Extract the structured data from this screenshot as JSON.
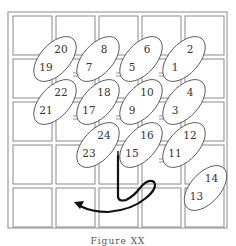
{
  "grid": {
    "rows": 5,
    "cols": 5,
    "line_color": "#8a8a8a"
  },
  "ellipses": [
    {
      "labels": [
        "20",
        "19"
      ],
      "col": 1,
      "row": 1
    },
    {
      "labels": [
        "8",
        "7"
      ],
      "col": 2,
      "row": 1
    },
    {
      "labels": [
        "6",
        "5"
      ],
      "col": 3,
      "row": 1
    },
    {
      "labels": [
        "2",
        "1"
      ],
      "col": 4,
      "row": 1
    },
    {
      "labels": [
        "22",
        "21"
      ],
      "col": 1,
      "row": 2
    },
    {
      "labels": [
        "18",
        "17"
      ],
      "col": 2,
      "row": 2
    },
    {
      "labels": [
        "10",
        "9"
      ],
      "col": 3,
      "row": 2
    },
    {
      "labels": [
        "4",
        "3"
      ],
      "col": 4,
      "row": 2
    },
    {
      "labels": [
        "24",
        "23"
      ],
      "col": 2,
      "row": 3
    },
    {
      "labels": [
        "16",
        "15"
      ],
      "col": 3,
      "row": 3
    },
    {
      "labels": [
        "12",
        "11"
      ],
      "col": 4,
      "row": 3
    },
    {
      "labels": [
        "14",
        "13"
      ],
      "col": 4.5,
      "row": 4
    }
  ],
  "arrow": {
    "color": "#111111",
    "description": "curved path from cell 15 looping right and back left to bottom-left"
  },
  "caption": "Figure XX"
}
